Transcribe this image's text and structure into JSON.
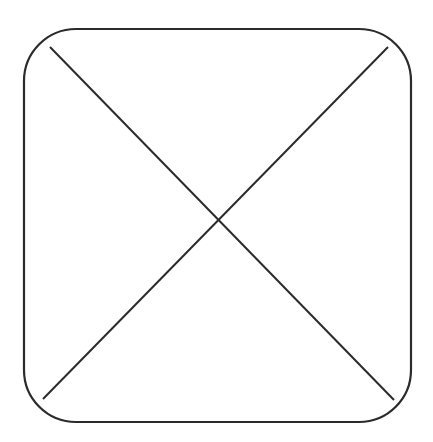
{
  "diagram": {
    "stroke_color": "#2b2b2b",
    "background": "#ffffff",
    "shape": {
      "x": 24,
      "y": 29,
      "width": 387,
      "height": 393,
      "corner_radius": 52
    },
    "diagonals": [
      {
        "x1": 50,
        "y1": 47,
        "x2": 394,
        "y2": 400
      },
      {
        "x1": 388,
        "y1": 47,
        "x2": 43,
        "y2": 399
      }
    ],
    "intersection": {
      "x": 219,
      "y": 218
    }
  }
}
